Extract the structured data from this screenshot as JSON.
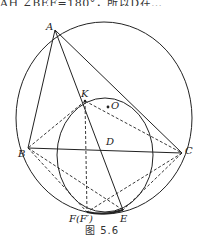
{
  "header": {
    "cropped_text": "AH ∠BEF=180°，所以D在…"
  },
  "figure": {
    "caption": "图 5.6",
    "points": {
      "A": "A",
      "K": "K",
      "O": "O",
      "D": "D",
      "B": "B",
      "C": "C",
      "F": "F(F′)",
      "E": "E"
    }
  }
}
